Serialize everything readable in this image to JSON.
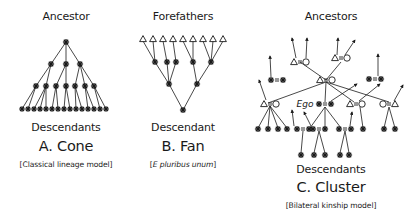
{
  "panels": [
    {
      "id": "cone",
      "top_label": "Ancestor",
      "bottom_label": "Descendants",
      "title": "A. Cone",
      "subtitle": "[Classical lineage model]",
      "subtitle_italic": false,
      "center_x": 66
    },
    {
      "id": "fan",
      "top_label": "Forefathers",
      "bottom_label": "Descendant",
      "title": "B. Fan",
      "subtitle_parts": [
        "[",
        "E pluribus unum",
        "]"
      ],
      "center_x": 183
    },
    {
      "id": "cluster",
      "top_label": "Ancestors",
      "bottom_label": "Descendants",
      "title": "C. Cluster",
      "subtitle": "[Bilateral kinship model]",
      "subtitle_italic": false,
      "center_x": 331,
      "ego_label": "Ego"
    }
  ],
  "symbols": {
    "person": "asterisk",
    "male": "triangle",
    "female": "circle",
    "marriage": "equals",
    "ancestry_link": "arrow"
  },
  "colors": {
    "ink": "#1a1a1a",
    "background": "#ffffff"
  },
  "cone": {
    "levels": [
      {
        "y": 42,
        "xs": [
          66
        ]
      },
      {
        "y": 64,
        "xs": [
          51,
          66,
          80
        ]
      },
      {
        "y": 86,
        "xs": [
          36,
          46,
          56,
          66,
          75,
          85,
          94
        ]
      },
      {
        "y": 109,
        "xs": [
          22,
          28,
          34,
          40,
          46,
          52,
          58,
          64,
          70,
          76,
          82,
          88,
          94,
          100,
          106
        ]
      }
    ],
    "edges": [
      [
        0,
        0,
        1,
        0
      ],
      [
        0,
        0,
        1,
        1
      ],
      [
        0,
        0,
        1,
        2
      ],
      [
        1,
        0,
        2,
        0
      ],
      [
        1,
        0,
        2,
        1
      ],
      [
        1,
        1,
        2,
        2
      ],
      [
        1,
        1,
        2,
        3
      ],
      [
        1,
        2,
        2,
        4
      ],
      [
        1,
        2,
        2,
        5
      ],
      [
        1,
        2,
        2,
        6
      ],
      [
        2,
        0,
        3,
        0
      ],
      [
        2,
        0,
        3,
        1
      ],
      [
        2,
        1,
        3,
        2
      ],
      [
        2,
        1,
        3,
        3
      ],
      [
        2,
        1,
        3,
        4
      ],
      [
        2,
        2,
        3,
        5
      ],
      [
        2,
        2,
        3,
        6
      ],
      [
        2,
        3,
        3,
        7
      ],
      [
        2,
        3,
        3,
        8
      ],
      [
        2,
        4,
        3,
        9
      ],
      [
        2,
        4,
        3,
        10
      ],
      [
        2,
        5,
        3,
        11
      ],
      [
        2,
        5,
        3,
        12
      ],
      [
        2,
        6,
        3,
        13
      ],
      [
        2,
        6,
        3,
        14
      ]
    ]
  },
  "fan": {
    "triangles": {
      "y": 39,
      "xs": [
        143,
        153,
        163,
        173,
        183,
        193,
        203,
        213,
        223
      ]
    },
    "level2": {
      "y": 62,
      "xs": [
        155,
        167,
        176,
        193,
        211
      ]
    },
    "level3": {
      "y": 84,
      "xs": [
        169,
        197
      ]
    },
    "root": {
      "x": 183,
      "y": 110
    },
    "tri_to_l2": [
      [
        0,
        0
      ],
      [
        1,
        0
      ],
      [
        2,
        1
      ],
      [
        3,
        2
      ],
      [
        4,
        3
      ],
      [
        5,
        3
      ],
      [
        6,
        4
      ],
      [
        7,
        4
      ],
      [
        8,
        4
      ]
    ],
    "l2_to_l3": [
      [
        0,
        0
      ],
      [
        1,
        0
      ],
      [
        2,
        0
      ],
      [
        3,
        1
      ],
      [
        4,
        1
      ]
    ]
  },
  "cluster": {
    "lines": [
      [
        300,
        62,
        326,
        80
      ],
      [
        341,
        62,
        326,
        80
      ],
      [
        326,
        82,
        268,
        103
      ],
      [
        326,
        82,
        325,
        102
      ],
      [
        326,
        82,
        354,
        102
      ],
      [
        326,
        82,
        389,
        102
      ],
      [
        270,
        106,
        258,
        128
      ],
      [
        270,
        106,
        268,
        128
      ],
      [
        270,
        106,
        278,
        128
      ],
      [
        270,
        106,
        287,
        128
      ],
      [
        325,
        107,
        310,
        128
      ],
      [
        325,
        107,
        325,
        128
      ],
      [
        325,
        107,
        341,
        128
      ],
      [
        303,
        131,
        301,
        153
      ],
      [
        319,
        131,
        314,
        153
      ],
      [
        319,
        131,
        325,
        153
      ],
      [
        345,
        131,
        340,
        153
      ],
      [
        345,
        131,
        349,
        153
      ],
      [
        360,
        107,
        363,
        128
      ],
      [
        389,
        107,
        384,
        128
      ],
      [
        389,
        107,
        395,
        128
      ]
    ],
    "arrows": [
      [
        296,
        58,
        292,
        38
      ],
      [
        306,
        58,
        307,
        38
      ],
      [
        337,
        55,
        338,
        38
      ],
      [
        345,
        55,
        355,
        40
      ],
      [
        271,
        77,
        270,
        56
      ],
      [
        378,
        76,
        378,
        54
      ],
      [
        266,
        100,
        259,
        80
      ],
      [
        294,
        126,
        292,
        110
      ],
      [
        311,
        126,
        304,
        112
      ],
      [
        331,
        101,
        357,
        84
      ],
      [
        359,
        101,
        380,
        84
      ],
      [
        394,
        101,
        403,
        85
      ],
      [
        350,
        126,
        352,
        112
      ]
    ],
    "couples": [
      {
        "x": 300,
        "y": 62,
        "left": "triangle",
        "right": "circle"
      },
      {
        "x": 341,
        "y": 58,
        "left": "triangle",
        "right": "circle"
      },
      {
        "x": 326,
        "y": 80,
        "left": "triangle",
        "right": "circle"
      },
      {
        "x": 270,
        "y": 104,
        "left": "triangle",
        "right": "circle"
      },
      {
        "x": 356,
        "y": 104,
        "left": "triangle",
        "right": "circle"
      },
      {
        "x": 389,
        "y": 104,
        "left": "circle",
        "right": "triangle"
      },
      {
        "x": 277,
        "y": 80,
        "left": "asterisk",
        "right": "asterisk"
      },
      {
        "x": 375,
        "y": 79,
        "left": "asterisk",
        "right": "asterisk"
      },
      {
        "x": 325,
        "y": 104,
        "left": "asterisk",
        "right": "asterisk"
      },
      {
        "x": 303,
        "y": 129,
        "left": "asterisk",
        "right": "asterisk"
      },
      {
        "x": 319,
        "y": 129,
        "left": "asterisk",
        "right": "asterisk"
      },
      {
        "x": 345,
        "y": 129,
        "left": "asterisk",
        "right": "asterisk"
      }
    ],
    "stars": [
      [
        258,
        129
      ],
      [
        268,
        129
      ],
      [
        278,
        129
      ],
      [
        287,
        129
      ],
      [
        363,
        129
      ],
      [
        384,
        129
      ],
      [
        395,
        129
      ],
      [
        301,
        155
      ],
      [
        314,
        155
      ],
      [
        325,
        155
      ],
      [
        340,
        155
      ],
      [
        349,
        155
      ]
    ],
    "ego_pos": [
      305,
      104
    ]
  }
}
